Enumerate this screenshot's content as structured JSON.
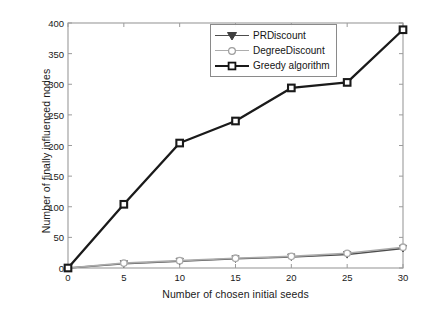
{
  "chart_data": {
    "type": "line",
    "title": "",
    "xlabel": "Number of chosen initial seeds",
    "ylabel": "Number of finally influenced nodes",
    "xlim": [
      0,
      30
    ],
    "ylim": [
      0,
      400
    ],
    "xticks": [
      0,
      5,
      10,
      15,
      20,
      25,
      30
    ],
    "yticks": [
      0,
      50,
      100,
      150,
      200,
      250,
      300,
      350,
      400
    ],
    "x": [
      0,
      5,
      10,
      15,
      20,
      25,
      30
    ],
    "grid": false,
    "legend_position": "top-right",
    "series": [
      {
        "name": "PRDiscount",
        "marker": "triangle-down",
        "color": "#4d4d4d",
        "values": [
          0,
          7,
          11,
          15,
          18,
          22,
          32
        ]
      },
      {
        "name": "DegreeDiscount",
        "marker": "circle",
        "color": "#aaaaaa",
        "values": [
          0,
          8,
          12,
          16,
          19,
          24,
          34
        ]
      },
      {
        "name": "Greedy algorithm",
        "marker": "square",
        "color": "#1a1a1a",
        "values": [
          0,
          104,
          204,
          240,
          294,
          303,
          389
        ]
      }
    ]
  },
  "legend": {
    "items": [
      {
        "label": "PRDiscount",
        "marker": "triangle-down-marker",
        "color": "#4d4d4d"
      },
      {
        "label": "DegreeDiscount",
        "marker": "circle-marker",
        "color": "#aaaaaa"
      },
      {
        "label": "Greedy algorithm",
        "marker": "square-marker",
        "color": "#1a1a1a"
      }
    ]
  },
  "axes": {
    "y_title": "Number of finally influenced nodes",
    "x_title": "Number of chosen initial seeds",
    "y_tick_labels": [
      "0",
      "50",
      "100",
      "150",
      "200",
      "250",
      "300",
      "350",
      "400"
    ],
    "x_tick_labels": [
      "0",
      "5",
      "10",
      "15",
      "20",
      "25",
      "30"
    ],
    "axis_color": "#9b9b9b"
  }
}
